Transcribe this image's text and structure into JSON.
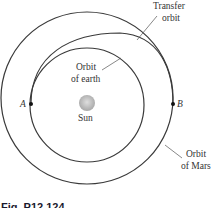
{
  "figure": {
    "caption": "Fig. P12.124",
    "labels": {
      "transfer_line1": "Transfer",
      "transfer_line2": "orbit",
      "earth_line1": "Orbit",
      "earth_line2": "of earth",
      "mars_line1": "Orbit",
      "mars_line2": "of Mars",
      "sun": "Sun",
      "point_a": "A",
      "point_b": "B"
    },
    "colors": {
      "orbit_stroke": "#3a3a3a",
      "sun_fill": "#b8b8b8",
      "text": "#333333"
    }
  }
}
